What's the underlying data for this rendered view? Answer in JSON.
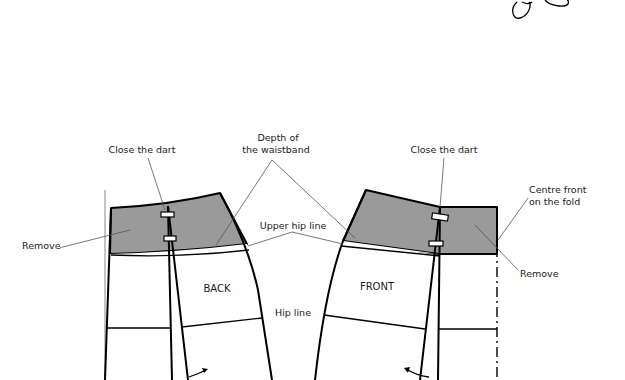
{
  "diagram": {
    "pieces": {
      "back": {
        "label": "BACK"
      },
      "front": {
        "label": "FRONT"
      }
    },
    "labels": {
      "close_dart_back": "Close the dart",
      "close_dart_front": "Close the dart",
      "depth_line1": "Depth of",
      "depth_line2": "the waistband",
      "upper_hip_line": "Upper hip line",
      "hip_line": "Hip line",
      "remove_back": "Remove",
      "remove_front": "Remove",
      "centre_front_line1": "Centre front",
      "centre_front_line2": "on the fold"
    },
    "colors": {
      "shaded_area": "#9a9a9a",
      "outline": "#000000",
      "leader": "#555555"
    },
    "decoration": {
      "icon": "scissors-loop-icon"
    }
  }
}
